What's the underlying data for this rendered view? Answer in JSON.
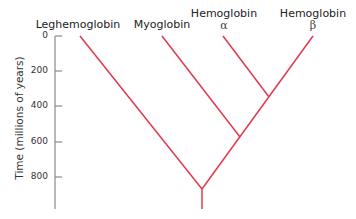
{
  "diagram": {
    "type": "phylogenetic-tree",
    "y_axis": {
      "label": "Time (millions of years)",
      "ticks": [
        "0",
        "200",
        "400",
        "600",
        "800"
      ]
    },
    "leaves": [
      {
        "name": "Leghemoglobin",
        "sub": ""
      },
      {
        "name": "Myoglobin",
        "sub": ""
      },
      {
        "name": "Hemoglobin",
        "sub": "α"
      },
      {
        "name": "Hemoglobin",
        "sub": "β"
      }
    ],
    "colors": {
      "branch": "#e0394f",
      "axis": "#888888"
    }
  }
}
